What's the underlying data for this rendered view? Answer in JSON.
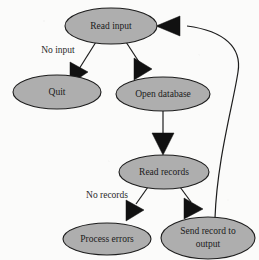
{
  "diagram": {
    "background_color": "#fbfbfa",
    "node_fill_color": "#aeaeae",
    "node_stroke_color": "#1d1d1d",
    "edge_color": "#1d1d1d",
    "text_color": "#1b1b1b",
    "nodes": [
      {
        "id": "read-input",
        "label": "Read input",
        "cx": 111,
        "cy": 26,
        "rx": 46,
        "ry": 18
      },
      {
        "id": "quit",
        "label": "Quit",
        "cx": 57,
        "cy": 92,
        "rx": 44,
        "ry": 17
      },
      {
        "id": "open-database",
        "label": "Open database",
        "cx": 163,
        "cy": 94,
        "rx": 47,
        "ry": 17
      },
      {
        "id": "read-records",
        "label": "Read records",
        "cx": 164,
        "cy": 172,
        "rx": 45,
        "ry": 17
      },
      {
        "id": "process-errors",
        "label": "Process errors",
        "cx": 107,
        "cy": 239,
        "rx": 44,
        "ry": 16
      },
      {
        "id": "send-record",
        "label_line1": "Send record to",
        "label_line2": "output",
        "cx": 208,
        "cy": 238,
        "rx": 47,
        "ry": 21
      }
    ],
    "edges": [
      {
        "id": "read-input-to-quit",
        "from": "read-input",
        "to": "quit",
        "label": "No input"
      },
      {
        "id": "read-input-to-open-database",
        "from": "read-input",
        "to": "open-database",
        "label": ""
      },
      {
        "id": "open-database-to-read-records",
        "from": "open-database",
        "to": "read-records",
        "label": ""
      },
      {
        "id": "read-records-to-process-errors",
        "from": "read-records",
        "to": "process-errors",
        "label": "No records"
      },
      {
        "id": "read-records-to-send-record",
        "from": "read-records",
        "to": "send-record",
        "label": ""
      },
      {
        "id": "send-record-to-read-input",
        "from": "send-record",
        "to": "read-input",
        "label": ""
      }
    ],
    "edge_labels": {
      "no_input": "No input",
      "no_records": "No records"
    }
  }
}
